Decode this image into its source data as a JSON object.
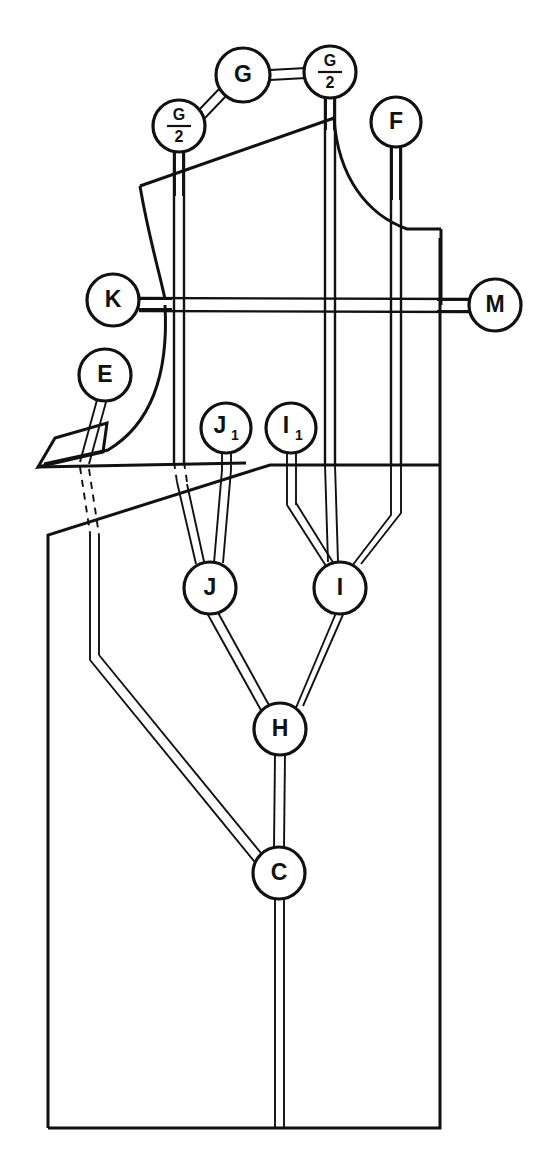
{
  "figure": {
    "type": "technical-pattern-drawing",
    "background_color": "#ffffff",
    "line_color": "#111111"
  },
  "nodes": [
    {
      "id": "G",
      "label": "G",
      "kind": "plain",
      "cx": 243,
      "cy": 75,
      "r": 27
    },
    {
      "id": "G2_left",
      "label": "G",
      "sub": "2",
      "kind": "fraction",
      "cx": 179,
      "cy": 126,
      "r": 24
    },
    {
      "id": "G2_right",
      "label": "G",
      "sub": "2",
      "kind": "fraction",
      "cx": 330,
      "cy": 72,
      "r": 24
    },
    {
      "id": "F",
      "label": "F",
      "kind": "plain",
      "cx": 396,
      "cy": 122,
      "r": 25
    },
    {
      "id": "K",
      "label": "K",
      "kind": "plain",
      "cx": 113,
      "cy": 300,
      "r": 26
    },
    {
      "id": "M",
      "label": "M",
      "kind": "plain",
      "cx": 495,
      "cy": 305,
      "r": 26
    },
    {
      "id": "E",
      "label": "E",
      "kind": "plain",
      "cx": 105,
      "cy": 375,
      "r": 26
    },
    {
      "id": "J1",
      "label": "J",
      "sub": "1",
      "kind": "subscript",
      "cx": 226,
      "cy": 428,
      "r": 25
    },
    {
      "id": "I1",
      "label": "I",
      "sub": "1",
      "kind": "subscript",
      "cx": 291,
      "cy": 428,
      "r": 25
    },
    {
      "id": "J",
      "label": "J",
      "kind": "plain",
      "cx": 210,
      "cy": 588,
      "r": 26
    },
    {
      "id": "I",
      "label": "I",
      "kind": "plain",
      "cx": 340,
      "cy": 588,
      "r": 26
    },
    {
      "id": "H",
      "label": "H",
      "kind": "plain",
      "cx": 280,
      "cy": 729,
      "r": 26
    },
    {
      "id": "C",
      "label": "C",
      "kind": "plain",
      "cx": 279,
      "cy": 873,
      "r": 26
    }
  ],
  "labels": {
    "G": "G",
    "G_over_2": "G/2",
    "F": "F",
    "K": "K",
    "M": "M",
    "E": "E",
    "J_sub_1": "J1",
    "I_sub_1": "I1",
    "J": "J",
    "I": "I",
    "H": "H",
    "C": "C",
    "fraction_numerator": "G",
    "fraction_denominator": "2",
    "subscript_one": "1"
  },
  "leaders": [
    {
      "name": "leader-G-to-G2left",
      "from": "G",
      "to": "G2_left"
    },
    {
      "name": "leader-G-to-G2right",
      "from": "G",
      "to": "G2_right"
    },
    {
      "name": "leader-G2left-stem",
      "from": "G2_left",
      "to": "shoulder-left-seam"
    },
    {
      "name": "leader-G2right-stem",
      "from": "G2_right",
      "to": "center-seam-top"
    },
    {
      "name": "leader-F-stem",
      "from": "F",
      "to": "right-inner-seam"
    },
    {
      "name": "leader-K-stem",
      "from": "K",
      "to": "bust-line-left"
    },
    {
      "name": "leader-M-stem",
      "from": "M",
      "to": "bust-line-right"
    },
    {
      "name": "leader-E-stem",
      "from": "E",
      "to": "side-seam"
    },
    {
      "name": "leader-J1-to-J",
      "from": "J1",
      "to": "J"
    },
    {
      "name": "leader-I1-to-I",
      "from": "I1",
      "to": "I"
    },
    {
      "name": "leader-J-to-H",
      "from": "J",
      "to": "H"
    },
    {
      "name": "leader-I-to-H",
      "from": "I",
      "to": "H"
    },
    {
      "name": "leader-H-to-C",
      "from": "H",
      "to": "C"
    },
    {
      "name": "leader-E-to-C",
      "from": "E",
      "to": "C"
    },
    {
      "name": "leader-C-to-hem",
      "from": "C",
      "to": "hem-line"
    }
  ],
  "pattern_pieces": [
    {
      "name": "bodice-upper",
      "description": "Upper bodice block with shoulder slope and neckline curve"
    },
    {
      "name": "small-facing",
      "description": "Small quadrilateral facing piece at left"
    },
    {
      "name": "lower-body",
      "description": "Lower rectangular body block with hem"
    }
  ]
}
